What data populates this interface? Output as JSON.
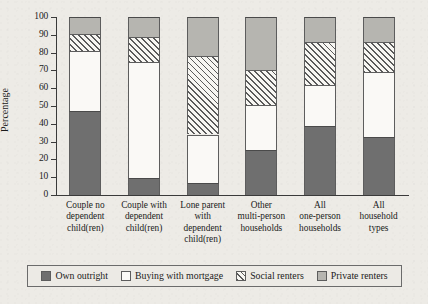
{
  "chart_data": {
    "type": "bar",
    "subtype": "stacked-bar-100-percent",
    "title": "",
    "xlabel": "",
    "ylabel": "Percentage",
    "ylim": [
      0,
      100
    ],
    "yticks": [
      0,
      10,
      20,
      30,
      40,
      50,
      60,
      70,
      80,
      90,
      100
    ],
    "grid": false,
    "legend_position": "bottom",
    "categories": [
      "Couple no dependent child(ren)",
      "Couple with dependent child(ren)",
      "Lone parent with dependent child(ren)",
      "Other multi-person households",
      "All one-person households",
      "All household types"
    ],
    "category_lines": [
      [
        "Couple no",
        "dependent",
        "child(ren)"
      ],
      [
        "Couple with",
        "dependent",
        "child(ren)"
      ],
      [
        "Lone parent",
        "with",
        "dependent",
        "child(ren)"
      ],
      [
        "Other",
        "multi-person",
        "households"
      ],
      [
        "All",
        "one-person",
        "households"
      ],
      [
        "All",
        "household",
        "types"
      ]
    ],
    "series": [
      {
        "name": "Own outright",
        "color": "#6f6f6f",
        "pattern": "solid",
        "values": [
          47,
          9.5,
          7,
          25.5,
          39,
          32.5
        ]
      },
      {
        "name": "Buying with mortgage",
        "color": "#fbfaf7",
        "pattern": "empty",
        "values": [
          34,
          65.5,
          27,
          25,
          23,
          36.5
        ]
      },
      {
        "name": "Social renters",
        "color": "#f7f6f2",
        "pattern": "diagonal-hatch",
        "values": [
          9.5,
          13.5,
          44,
          20,
          24,
          17
        ]
      },
      {
        "name": "Private renters",
        "color": "#b6b5b0",
        "pattern": "solid-light",
        "values": [
          9.5,
          11.5,
          22,
          29.5,
          14,
          14
        ]
      }
    ],
    "cumulative_tops": [
      [
        47,
        81,
        90.5,
        100
      ],
      [
        9.5,
        75,
        88.5,
        100
      ],
      [
        7,
        34,
        78,
        100
      ],
      [
        25.5,
        50.5,
        70.5,
        100
      ],
      [
        39,
        62,
        86,
        100
      ],
      [
        32.5,
        69,
        86,
        100
      ]
    ]
  },
  "legend": {
    "items": [
      {
        "label": "Own outright",
        "swatch": "own"
      },
      {
        "label": "Buying with mortgage",
        "swatch": "buy"
      },
      {
        "label": "Social renters",
        "swatch": "social"
      },
      {
        "label": "Private renters",
        "swatch": "priv"
      }
    ]
  }
}
